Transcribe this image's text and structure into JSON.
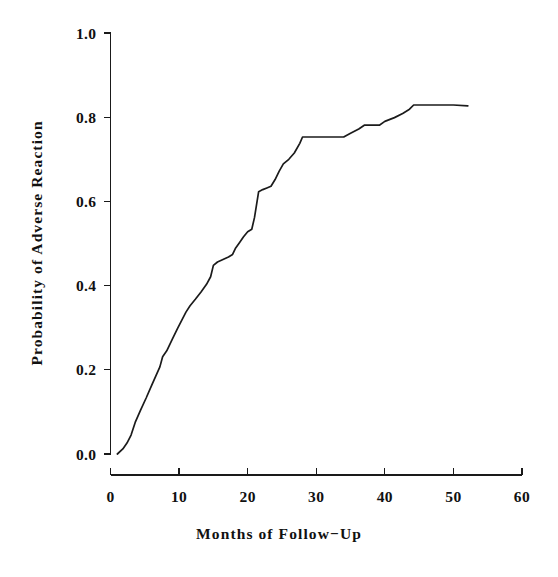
{
  "chart_data": {
    "type": "line",
    "title": "",
    "subtitle": "",
    "xlabel": "Months of Follow−Up",
    "ylabel": "Probability of Adverse Reaction",
    "xlim": [
      0,
      60
    ],
    "ylim": [
      0.0,
      1.0
    ],
    "xticks": [
      0,
      10,
      20,
      30,
      40,
      50,
      60
    ],
    "xtick_labels": [
      "0",
      "10",
      "20",
      "30",
      "40",
      "50",
      "60"
    ],
    "yticks": [
      0.0,
      0.2,
      0.4,
      0.6,
      0.8,
      1.0
    ],
    "ytick_labels": [
      "0.0",
      "0.2",
      "0.4",
      "0.6",
      "0.8",
      "1.0"
    ],
    "grid": false,
    "legend": false,
    "legend_position": "none",
    "line_color": "#1b1b1b",
    "background_color": "#ffffff",
    "series": [
      {
        "name": "Cumulative probability of adverse reaction",
        "x": [
          1.0,
          1.8,
          2.4,
          3.0,
          3.6,
          4.4,
          5.2,
          6.0,
          6.6,
          7.2,
          7.6,
          8.2,
          9.0,
          9.8,
          10.4,
          11.0,
          11.6,
          12.4,
          13.2,
          14.0,
          14.6,
          15.0,
          15.6,
          16.4,
          17.2,
          17.8,
          18.2,
          18.8,
          19.4,
          20.0,
          20.6,
          21.0,
          21.6,
          22.2,
          22.8,
          23.4,
          24.0,
          24.6,
          25.2,
          26.0,
          26.8,
          27.6,
          28.0,
          30.0,
          32.0,
          33.6,
          34.0,
          35.0,
          36.2,
          37.0,
          38.0,
          39.2,
          40.0,
          41.4,
          42.6,
          43.6,
          44.2,
          46.0,
          48.0,
          50.0,
          52.1
        ],
        "y": [
          0.0,
          0.012,
          0.026,
          0.045,
          0.075,
          0.105,
          0.133,
          0.163,
          0.185,
          0.207,
          0.231,
          0.245,
          0.272,
          0.299,
          0.318,
          0.337,
          0.352,
          0.368,
          0.385,
          0.403,
          0.421,
          0.448,
          0.456,
          0.462,
          0.468,
          0.474,
          0.488,
          0.502,
          0.516,
          0.528,
          0.534,
          0.562,
          0.623,
          0.628,
          0.632,
          0.636,
          0.652,
          0.672,
          0.689,
          0.7,
          0.715,
          0.738,
          0.753,
          0.753,
          0.753,
          0.753,
          0.753,
          0.762,
          0.772,
          0.781,
          0.781,
          0.781,
          0.79,
          0.799,
          0.809,
          0.819,
          0.829,
          0.829,
          0.829,
          0.829,
          0.827
        ]
      }
    ]
  }
}
